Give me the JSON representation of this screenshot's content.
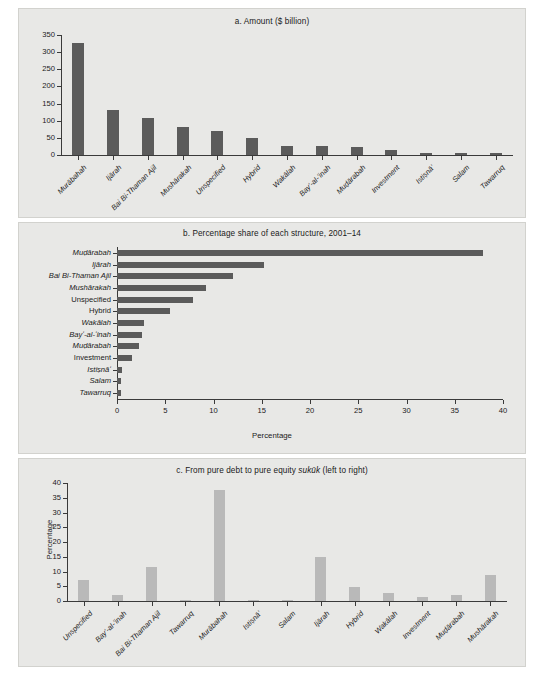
{
  "figure": {
    "background": "#e8e8e6",
    "bar_color_dark": "#5b5b5b",
    "bar_color_light": "#b9b9b9",
    "axis_color": "#3a3a3a"
  },
  "panels": {
    "a": {
      "title_prefix": "a. Amount ($ billion)",
      "ylabel": "",
      "xlabel": ""
    },
    "b": {
      "title_prefix": "b. Percentage share of each structure, 2001–14",
      "xlabel": "Percentage"
    },
    "c": {
      "title_pre": "c. From pure debt to pure equity ",
      "title_italic": "sukūk",
      "title_post": " (left to right)",
      "ylabel": "Percentage"
    }
  },
  "chart_data": [
    {
      "id": "a",
      "type": "bar",
      "title": "a. Amount ($ billion)",
      "xlabel": "",
      "ylabel": "",
      "ylim": [
        0,
        350
      ],
      "yticks": [
        0,
        50,
        100,
        150,
        200,
        250,
        300,
        350
      ],
      "grid": false,
      "orientation": "vertical",
      "bar_color": "#5b5b5b",
      "categories": [
        "Murābahah",
        "Ijārah",
        "Bai Bi-Thaman Ajil",
        "Mushārakah",
        "Unspecified",
        "Hybrid",
        "Wakālah",
        "Bayʻ-al-ʻinah",
        "Muḍārabah",
        "Investment",
        "Istiṣnāʻ",
        "Salam",
        "Tawarruq"
      ],
      "values": [
        327,
        132,
        107,
        81,
        70,
        49,
        27,
        25,
        22,
        16,
        6,
        6,
        5
      ]
    },
    {
      "id": "b",
      "type": "bar",
      "title": "b. Percentage share of each structure, 2001–14",
      "xlabel": "Percentage",
      "ylabel": "",
      "xlim": [
        0,
        40
      ],
      "xticks": [
        0,
        5,
        10,
        15,
        20,
        25,
        30,
        35,
        40
      ],
      "grid": false,
      "orientation": "horizontal",
      "bar_color": "#5b5b5b",
      "categories": [
        "Tawarruq",
        "Salam",
        "Istiṣnāʻ",
        "Investment",
        "Muḍārabah",
        "Bayʻ-al-ʻinah",
        "Wakālah",
        "Hybrid",
        "Unspecified",
        "Mushārakah",
        "Bai Bi-Thaman Ajil",
        "Ijārah",
        "Muḍārabah"
      ],
      "values": [
        0.4,
        0.4,
        0.5,
        1.6,
        2.3,
        2.6,
        2.8,
        5.5,
        7.9,
        9.2,
        12.0,
        15.2,
        37.9
      ]
    },
    {
      "id": "c",
      "type": "bar",
      "title": "c. From pure debt to pure equity sukūk (left to right)",
      "xlabel": "",
      "ylabel": "Percentage",
      "ylim": [
        0,
        40
      ],
      "yticks": [
        0,
        5,
        10,
        15,
        20,
        25,
        30,
        35,
        40
      ],
      "grid": false,
      "orientation": "vertical",
      "bar_color": "#b9b9b9",
      "categories": [
        "Unspecified",
        "Bayʻ-al-ʻinah",
        "Bai Bi-Thaman Ajil",
        "Tawarruq",
        "Murābahah",
        "Istiṣnāʻ",
        "Salam",
        "Ijārah",
        "Hybrid",
        "Wakālah",
        "Investment",
        "Muḍārabah",
        "Mushārakah"
      ],
      "values": [
        7.2,
        2.2,
        11.5,
        0.3,
        37.8,
        0.4,
        0.3,
        14.8,
        4.9,
        2.6,
        1.4,
        2.0,
        8.9
      ]
    }
  ]
}
